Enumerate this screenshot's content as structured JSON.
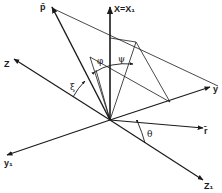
{
  "diagram": {
    "type": "3d-coordinate-geometry",
    "labels": {
      "x_axis": "X=X₁",
      "p_vector": "p̄",
      "z_axis": "Z",
      "y_axis": "y",
      "r_vector": "r̄",
      "z1_axis": "Z₁",
      "y1_axis": "y₁",
      "angle_xi": "ξ",
      "angle_phi": "φ",
      "angle_psi": "ψ",
      "angle_theta": "θ"
    },
    "origin": [
      110,
      120
    ],
    "colors": {
      "ink": "#1a1a1a",
      "background": "#ffffff"
    }
  }
}
